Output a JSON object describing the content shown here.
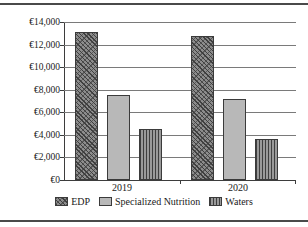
{
  "figure": {
    "title_clipped": "",
    "frame_color": "#4a4a4a"
  },
  "chart_data": {
    "type": "bar",
    "title": "",
    "subtitle": "",
    "xlabel": "",
    "ylabel": "",
    "categories": [
      "2019",
      "2020"
    ],
    "series": [
      {
        "name": "EDP",
        "values": [
          13100,
          12800
        ],
        "pattern": "diagonal-hatch",
        "color": "#8c8c8c"
      },
      {
        "name": "Specialized Nutrition",
        "values": [
          7550,
          7200
        ],
        "pattern": "solid",
        "color": "#b8b8b8"
      },
      {
        "name": "Waters",
        "values": [
          4550,
          3600
        ],
        "pattern": "vertical-stripes",
        "color": "#9a9a9a"
      }
    ],
    "ylim": [
      0,
      14000
    ],
    "ytick_values": [
      0,
      2000,
      4000,
      6000,
      8000,
      10000,
      12000,
      14000
    ],
    "ytick_labels": [
      "€0",
      "€2,000",
      "€4,000",
      "€6,000",
      "€8,000",
      "€10,000",
      "€12,000",
      "€14,000"
    ],
    "xtick_labels": [
      "2019",
      "2020"
    ],
    "grid": true,
    "grid_axis": "y",
    "legend": true,
    "legend_position": "bottom",
    "currency_symbol": "€"
  },
  "legend": {
    "items": [
      {
        "label": "EDP"
      },
      {
        "label": "Specialized Nutrition"
      },
      {
        "label": "Waters"
      }
    ]
  }
}
